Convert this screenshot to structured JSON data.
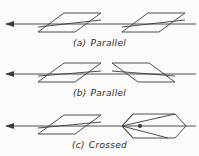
{
  "figure": {
    "background_color": "#fbfbf9",
    "ink_color": "#3a3a3a",
    "width": 199,
    "height": 156
  },
  "rows": [
    {
      "id": "a",
      "caption_tag": "(a)",
      "caption_word": "Parallel",
      "description": "Two identically slanted parallelograms on a common horizontal ray axis",
      "axis": {
        "y": 24,
        "x_start": 6,
        "x_end": 196,
        "arrow": "right-arrowhead",
        "arrow_x": 6
      },
      "shapes": [
        {
          "name": "prism-left",
          "type": "parallelogram",
          "points": "38,32 64,13 101,13 75,32",
          "internal_ray": "38,27 101,20"
        },
        {
          "name": "prism-right",
          "type": "parallelogram",
          "points": "122,32 148,13 185,13 159,32",
          "internal_ray": "122,27 185,20"
        }
      ]
    },
    {
      "id": "b",
      "caption_tag": "(b)",
      "caption_word": "Parallel",
      "description": "Left parallelogram slants up-right, right parallelogram is mirrored",
      "axis": {
        "y": 24,
        "x_start": 6,
        "x_end": 196,
        "arrow": "right-arrowhead",
        "arrow_x": 6
      },
      "shapes": [
        {
          "name": "prism-left",
          "type": "parallelogram",
          "points": "38,32 64,13 101,13 75,32",
          "internal_ray": "38,26 101,21"
        },
        {
          "name": "prism-right",
          "type": "parallelogram",
          "points": "112,13 149,13 175,32 138,32",
          "internal_ray": "112,21 175,26"
        }
      ]
    },
    {
      "id": "c",
      "caption_tag": "(c)",
      "caption_word": "Crossed",
      "description": "Left parallelogram; right hexagonal block with converging crossed rays and a focal dot",
      "axis": {
        "y": 26,
        "x_start": 6,
        "x_end": 196,
        "arrow": "right-arrowhead",
        "arrow_x": 6
      },
      "shapes": [
        {
          "name": "prism-left",
          "type": "parallelogram",
          "points": "38,34 64,15 101,15 75,34",
          "internal_ray": "38,28 101,22"
        },
        {
          "name": "lens-block-right",
          "type": "hexagon",
          "points": "122,26 133,14 175,14 186,26 175,38 133,38",
          "focus_point": {
            "x": 140,
            "y": 26,
            "r": 2
          },
          "convergence_vertex": {
            "x": 122,
            "y": 26
          },
          "rays": [
            "122,26 175,14",
            "122,26 186,26",
            "122,26 168,38",
            "133,14 122,26",
            "133,38 122,26",
            "122,26 140,26"
          ]
        }
      ]
    }
  ]
}
